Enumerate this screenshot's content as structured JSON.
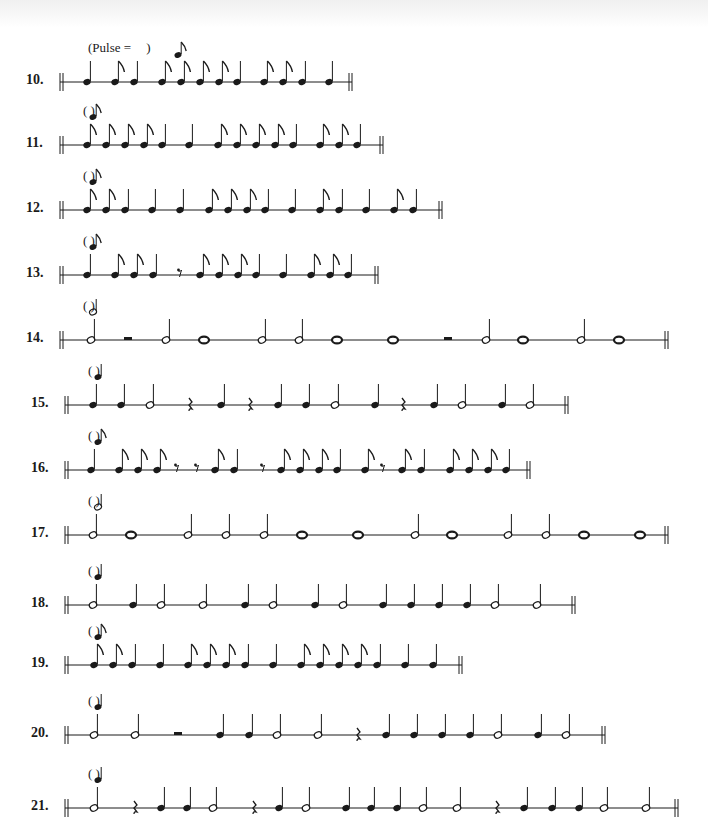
{
  "page": {
    "header_pulse_text": "(Pulse = ",
    "header_pulse_close": ")"
  },
  "exercises": [
    {
      "number": "10.",
      "pulse": "eighth",
      "y": 82,
      "start": 60,
      "end": 352,
      "notes": [
        [
          "q",
          87
        ],
        [
          "e",
          115
        ],
        [
          "q",
          134
        ],
        [
          "e",
          162
        ],
        [
          "e",
          181
        ],
        [
          "e",
          200
        ],
        [
          "e",
          219
        ],
        [
          "q",
          237
        ],
        [
          "e",
          264
        ],
        [
          "e",
          283
        ],
        [
          "q",
          302
        ],
        [
          "q",
          329
        ]
      ]
    },
    {
      "number": "11.",
      "pulse": "eighth",
      "y": 145,
      "start": 60,
      "end": 383,
      "notes": [
        [
          "e",
          87
        ],
        [
          "e",
          106
        ],
        [
          "e",
          125
        ],
        [
          "e",
          144
        ],
        [
          "q",
          162
        ],
        [
          "q",
          189
        ],
        [
          "e",
          218
        ],
        [
          "e",
          237
        ],
        [
          "e",
          256
        ],
        [
          "e",
          275
        ],
        [
          "q",
          293
        ],
        [
          "e",
          320
        ],
        [
          "e",
          339
        ],
        [
          "q",
          357
        ]
      ]
    },
    {
      "number": "12.",
      "pulse": "eighth",
      "y": 210,
      "start": 60,
      "end": 442,
      "notes": [
        [
          "e",
          87
        ],
        [
          "e",
          106
        ],
        [
          "q",
          125
        ],
        [
          "q",
          152
        ],
        [
          "q",
          180
        ],
        [
          "e",
          209
        ],
        [
          "e",
          228
        ],
        [
          "e",
          247
        ],
        [
          "q",
          265
        ],
        [
          "q",
          292
        ],
        [
          "e",
          320
        ],
        [
          "q",
          339
        ],
        [
          "q",
          366
        ],
        [
          "e",
          394
        ],
        [
          "q",
          413
        ]
      ]
    },
    {
      "number": "13.",
      "pulse": "eighth",
      "y": 275,
      "start": 60,
      "end": 378,
      "notes": [
        [
          "q",
          87
        ],
        [
          "e",
          115
        ],
        [
          "e",
          134
        ],
        [
          "q",
          153
        ],
        [
          "er",
          180
        ],
        [
          "e",
          200
        ],
        [
          "e",
          219
        ],
        [
          "e",
          238
        ],
        [
          "q",
          256
        ],
        [
          "q",
          283
        ],
        [
          "e",
          311
        ],
        [
          "e",
          330
        ],
        [
          "q",
          348
        ]
      ]
    },
    {
      "number": "14.",
      "pulse": "half",
      "y": 340,
      "start": 60,
      "end": 668,
      "notes": [
        [
          "h",
          91
        ],
        [
          "hr",
          128
        ],
        [
          "h",
          166
        ],
        [
          "w",
          204
        ],
        [
          "h",
          262
        ],
        [
          "h",
          299
        ],
        [
          "w",
          337
        ],
        [
          "w",
          393
        ],
        [
          "hr",
          448
        ],
        [
          "h",
          486
        ],
        [
          "w",
          523
        ],
        [
          "h",
          581
        ],
        [
          "w",
          619
        ]
      ]
    },
    {
      "number": "15.",
      "pulse": "quarter",
      "y": 405,
      "start": 65,
      "end": 568,
      "notes": [
        [
          "q",
          93
        ],
        [
          "q",
          121
        ],
        [
          "h",
          150
        ],
        [
          "qr",
          190
        ],
        [
          "q",
          221
        ],
        [
          "qr",
          250
        ],
        [
          "q",
          278
        ],
        [
          "q",
          306
        ],
        [
          "h",
          335
        ],
        [
          "q",
          375
        ],
        [
          "qr",
          403
        ],
        [
          "q",
          434
        ],
        [
          "h",
          462
        ],
        [
          "q",
          502
        ],
        [
          "h",
          530
        ]
      ]
    },
    {
      "number": "16.",
      "pulse": "eighth",
      "y": 470,
      "start": 65,
      "end": 530,
      "notes": [
        [
          "q",
          91
        ],
        [
          "e",
          119
        ],
        [
          "e",
          138
        ],
        [
          "e",
          157
        ],
        [
          "er",
          177
        ],
        [
          "er",
          197
        ],
        [
          "e",
          215
        ],
        [
          "q",
          234
        ],
        [
          "er",
          263
        ],
        [
          "e",
          281
        ],
        [
          "e",
          300
        ],
        [
          "e",
          319
        ],
        [
          "q",
          337
        ],
        [
          "e",
          365
        ],
        [
          "er",
          383
        ],
        [
          "e",
          402
        ],
        [
          "q",
          421
        ],
        [
          "e",
          450
        ],
        [
          "e",
          469
        ],
        [
          "e",
          488
        ],
        [
          "q",
          506
        ]
      ]
    },
    {
      "number": "17.",
      "pulse": "half",
      "y": 535,
      "start": 65,
      "end": 668,
      "notes": [
        [
          "h",
          93
        ],
        [
          "w",
          131
        ],
        [
          "h",
          188
        ],
        [
          "h",
          226
        ],
        [
          "h",
          264
        ],
        [
          "w",
          302
        ],
        [
          "w",
          358
        ],
        [
          "h",
          415
        ],
        [
          "w",
          452
        ],
        [
          "h",
          508
        ],
        [
          "h",
          546
        ],
        [
          "w",
          584
        ],
        [
          "w",
          640
        ]
      ]
    },
    {
      "number": "18.",
      "pulse": "quarter",
      "y": 605,
      "start": 65,
      "end": 575,
      "notes": [
        [
          "h",
          93
        ],
        [
          "q",
          133
        ],
        [
          "h",
          161
        ],
        [
          "h",
          203
        ],
        [
          "q",
          245
        ],
        [
          "h",
          273
        ],
        [
          "q",
          315
        ],
        [
          "h",
          343
        ],
        [
          "q",
          383
        ],
        [
          "q",
          411
        ],
        [
          "q",
          439
        ],
        [
          "q",
          467
        ],
        [
          "h",
          495
        ],
        [
          "h",
          537
        ]
      ]
    },
    {
      "number": "19.",
      "pulse": "eighth",
      "y": 665,
      "start": 65,
      "end": 462,
      "notes": [
        [
          "e",
          94
        ],
        [
          "e",
          113
        ],
        [
          "q",
          132
        ],
        [
          "q",
          160
        ],
        [
          "e",
          188
        ],
        [
          "e",
          207
        ],
        [
          "e",
          226
        ],
        [
          "q",
          245
        ],
        [
          "q",
          273
        ],
        [
          "e",
          301
        ],
        [
          "e",
          320
        ],
        [
          "e",
          339
        ],
        [
          "e",
          358
        ],
        [
          "q",
          377
        ],
        [
          "q",
          405
        ],
        [
          "q",
          433
        ]
      ]
    },
    {
      "number": "20.",
      "pulse": "quarter",
      "y": 735,
      "start": 65,
      "end": 605,
      "notes": [
        [
          "h",
          94
        ],
        [
          "h",
          135
        ],
        [
          "hr",
          178
        ],
        [
          "q",
          220
        ],
        [
          "q",
          249
        ],
        [
          "h",
          277
        ],
        [
          "h",
          318
        ],
        [
          "qr",
          358
        ],
        [
          "q",
          386
        ],
        [
          "q",
          414
        ],
        [
          "q",
          442
        ],
        [
          "q",
          470
        ],
        [
          "h",
          498
        ],
        [
          "q",
          538
        ],
        [
          "h",
          566
        ]
      ]
    },
    {
      "number": "21.",
      "pulse": "quarter",
      "y": 808,
      "start": 65,
      "end": 678,
      "notes": [
        [
          "h",
          94
        ],
        [
          "qr",
          135
        ],
        [
          "q",
          161
        ],
        [
          "q",
          187
        ],
        [
          "h",
          213
        ],
        [
          "qr",
          254
        ],
        [
          "q",
          279
        ],
        [
          "h",
          306
        ],
        [
          "q",
          346
        ],
        [
          "q",
          371
        ],
        [
          "q",
          397
        ],
        [
          "h",
          423
        ],
        [
          "h",
          457
        ],
        [
          "qr",
          497
        ],
        [
          "q",
          524
        ],
        [
          "q",
          552
        ],
        [
          "q",
          579
        ],
        [
          "h",
          604
        ],
        [
          "h",
          646
        ]
      ]
    }
  ]
}
